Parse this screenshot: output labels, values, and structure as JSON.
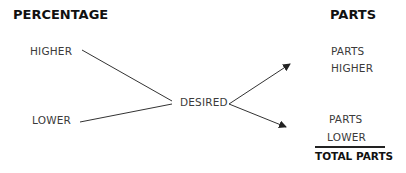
{
  "headers": {
    "left": "PERCENTAGE",
    "right": "PARTS"
  },
  "left_labels": {
    "higher": "HIGHER",
    "lower": "LOWER"
  },
  "center_label": "DESIRED",
  "right_labels": {
    "higher_line1": "PARTS",
    "higher_line2": "HIGHER",
    "lower_line1": "PARTS",
    "lower_line2": "LOWER",
    "total": "TOTAL PARTS"
  },
  "colors": {
    "line": "#333333",
    "text": "#3a3a3a",
    "header": "#111111"
  }
}
